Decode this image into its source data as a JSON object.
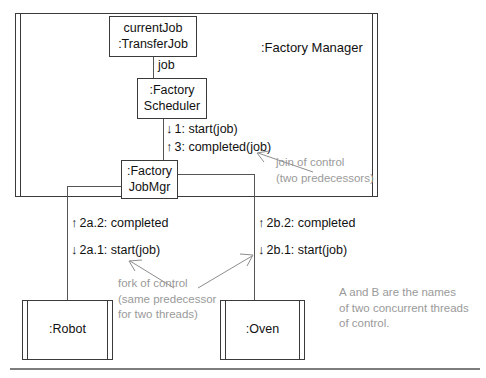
{
  "diagram": {
    "kind": "uml-communication-diagram",
    "container": {
      "label": ":Factory Manager"
    },
    "objects": [
      {
        "id": "currentJob",
        "line1": "currentJob",
        "line2": ":TransferJob",
        "active": false
      },
      {
        "id": "scheduler",
        "line1": ":Factory",
        "line2": "Scheduler",
        "active": false
      },
      {
        "id": "jobmgr",
        "line1": ":Factory",
        "line2": "JobMgr",
        "active": false
      },
      {
        "id": "robot",
        "line1": ":Robot",
        "line2": "",
        "active": true
      },
      {
        "id": "oven",
        "line1": ":Oven",
        "line2": "",
        "active": true
      }
    ],
    "link_roles": [
      {
        "id": "job-role",
        "label": "job"
      }
    ],
    "messages": [
      {
        "id": "m1",
        "direction": "down",
        "arrow": "↓",
        "text": "1: start(job)"
      },
      {
        "id": "m3",
        "direction": "up",
        "arrow": "↑",
        "text": "3: completed(job)"
      },
      {
        "id": "m2a2",
        "direction": "up",
        "arrow": "↑",
        "text": "2a.2: completed"
      },
      {
        "id": "m2a1",
        "direction": "down",
        "arrow": "↓",
        "text": "2a.1: start(job)"
      },
      {
        "id": "m2b2",
        "direction": "up",
        "arrow": "↑",
        "text": "2b.2: completed"
      },
      {
        "id": "m2b1",
        "direction": "down",
        "arrow": "↓",
        "text": "2b.1: start(job)"
      }
    ],
    "annotations": [
      {
        "id": "join-note",
        "text": "join of control\n(two predecessors)"
      },
      {
        "id": "fork-note",
        "text": "fork of control\n(same predecessor\nfor two threads)"
      },
      {
        "id": "threads-note",
        "text": "A and B are the names\nof two concurrent threads\nof control."
      }
    ],
    "colors": {
      "stroke": "#3a3a3a",
      "link": "#555555",
      "text": "#111111",
      "note": "#9a9a9a",
      "background": "#ffffff",
      "rule": "#7d7d7d"
    }
  }
}
